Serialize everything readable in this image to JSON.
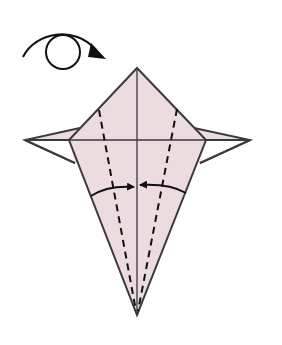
{
  "diagram": {
    "type": "origami-step",
    "instruction_symbol": "turn-over",
    "colors": {
      "paper": "#ecdbdf",
      "line": "#3a3a3a",
      "crease": "#555555",
      "arrow": "#111111",
      "background": "#ffffff"
    },
    "elements": [
      {
        "name": "turn-over-symbol",
        "description": "circle with curved arrow indicating flip the model over"
      },
      {
        "name": "kite-body",
        "description": "pink kite shape with upper triangle and long lower point"
      },
      {
        "name": "left-wing-flap",
        "description": "small pointed flap extending left"
      },
      {
        "name": "right-wing-flap",
        "description": "small pointed flap extending right"
      },
      {
        "name": "valley-fold-left",
        "description": "dashed valley fold line on left"
      },
      {
        "name": "valley-fold-right",
        "description": "dashed valley fold line on right"
      },
      {
        "name": "fold-arrow-left",
        "description": "curved arrow folding left edge to center"
      },
      {
        "name": "fold-arrow-right",
        "description": "curved arrow folding right edge to center"
      }
    ]
  }
}
